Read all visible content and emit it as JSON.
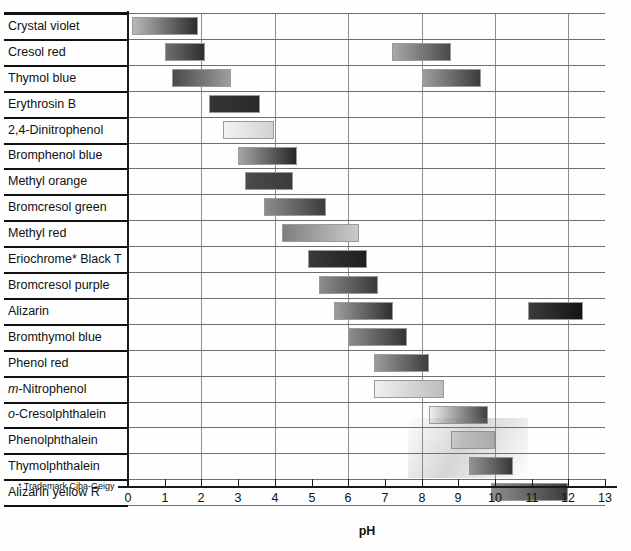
{
  "chart_data": {
    "type": "bar",
    "title": "",
    "xlabel": "pH",
    "ylabel": "",
    "xlim": [
      0,
      13
    ],
    "xticks": [
      "0",
      "1",
      "2",
      "3",
      "4",
      "5",
      "6",
      "7",
      "8",
      "9",
      "10",
      "11",
      "12",
      "13"
    ],
    "gridlines_every": 2,
    "orientation": "horizontal-range",
    "footnote": "* Trademark Ciba-Geigy",
    "categories": [
      "Crystal violet",
      "Cresol red",
      "Thymol blue",
      "Erythrosin B",
      "2,4-Dinitrophenol",
      "Bromphenol blue",
      "Methyl orange",
      "Bromcresol green",
      "Methyl red",
      "Eriochrome* Black T",
      "Bromcresol purple",
      "Alizarin",
      "Bromthymol blue",
      "Phenol red",
      "m-Nitrophenol",
      "o-Cresolphthalein",
      "Phenolphthalein",
      "Thymolphthalein",
      "Alizarin yellow R"
    ],
    "rows": [
      {
        "name": "Crystal violet",
        "italic_prefix": "",
        "ranges": [
          {
            "start": 0.1,
            "end": 1.9,
            "from": "#b9b9b9",
            "to": "#2c2c2c"
          }
        ]
      },
      {
        "name": "Cresol red",
        "italic_prefix": "",
        "ranges": [
          {
            "start": 1.0,
            "end": 2.1,
            "from": "#6f6f6f",
            "to": "#2e2e2e"
          },
          {
            "start": 7.2,
            "end": 8.8,
            "from": "#a8a8a8",
            "to": "#4a4a4a"
          }
        ]
      },
      {
        "name": "Thymol blue",
        "italic_prefix": "",
        "ranges": [
          {
            "start": 1.2,
            "end": 2.8,
            "from": "#4a4a4a",
            "to": "#9d9d9d"
          },
          {
            "start": 8.0,
            "end": 9.6,
            "from": "#9e9e9e",
            "to": "#3b3b3b"
          }
        ]
      },
      {
        "name": "Erythrosin B",
        "italic_prefix": "",
        "ranges": [
          {
            "start": 2.2,
            "end": 3.6,
            "from": "#353535",
            "to": "#2a2a2a"
          }
        ]
      },
      {
        "name": "2,4-Dinitrophenol",
        "italic_prefix": "",
        "ranges": [
          {
            "start": 2.6,
            "end": 4.0,
            "from": "#f2f2f2",
            "to": "#d3d3d3"
          }
        ]
      },
      {
        "name": "Bromphenol blue",
        "italic_prefix": "",
        "ranges": [
          {
            "start": 3.0,
            "end": 4.6,
            "from": "#a6a6a6",
            "to": "#272727"
          }
        ]
      },
      {
        "name": "Methyl orange",
        "italic_prefix": "",
        "ranges": [
          {
            "start": 3.2,
            "end": 4.5,
            "from": "#4b4b4b",
            "to": "#3b3b3b"
          }
        ]
      },
      {
        "name": "Bromcresol green",
        "italic_prefix": "",
        "ranges": [
          {
            "start": 3.7,
            "end": 5.4,
            "from": "#8d8d8d",
            "to": "#3c3c3c"
          }
        ]
      },
      {
        "name": "Methyl red",
        "italic_prefix": "",
        "ranges": [
          {
            "start": 4.2,
            "end": 6.3,
            "from": "#7f7f7f",
            "to": "#cacaca"
          }
        ]
      },
      {
        "name": "Eriochrome* Black T",
        "italic_prefix": "",
        "ranges": [
          {
            "start": 4.9,
            "end": 6.5,
            "from": "#3a3a3a",
            "to": "#1f1f1f"
          }
        ]
      },
      {
        "name": "Bromcresol purple",
        "italic_prefix": "",
        "ranges": [
          {
            "start": 5.2,
            "end": 6.8,
            "from": "#8c8c8c",
            "to": "#3a3a3a"
          }
        ]
      },
      {
        "name": "Alizarin",
        "italic_prefix": "",
        "ranges": [
          {
            "start": 5.6,
            "end": 7.2,
            "from": "#9d9d9d",
            "to": "#2f2f2f"
          },
          {
            "start": 10.9,
            "end": 12.4,
            "from": "#3b3b3b",
            "to": "#141414"
          }
        ]
      },
      {
        "name": "Bromthymol blue",
        "italic_prefix": "",
        "ranges": [
          {
            "start": 6.0,
            "end": 7.6,
            "from": "#8d8d8d",
            "to": "#343434"
          }
        ]
      },
      {
        "name": "Phenol red",
        "italic_prefix": "",
        "ranges": [
          {
            "start": 6.7,
            "end": 8.2,
            "from": "#9c9c9c",
            "to": "#3d3d3d"
          }
        ]
      },
      {
        "name": "m-Nitrophenol",
        "italic_prefix": "m",
        "ranges": [
          {
            "start": 6.7,
            "end": 8.6,
            "from": "#f0f0f0",
            "to": "#bcbcbc"
          }
        ]
      },
      {
        "name": "o-Cresolphthalein",
        "italic_prefix": "o",
        "ranges": [
          {
            "start": 8.2,
            "end": 9.8,
            "from": "#f0f0f0",
            "to": "#3f3f3f"
          }
        ]
      },
      {
        "name": "Phenolphthalein",
        "italic_prefix": "",
        "ranges": [
          {
            "start": 8.8,
            "end": 10.0,
            "from": "#e4e4e4",
            "to": "#b7b7b7"
          }
        ]
      },
      {
        "name": "Thymolphthalein",
        "italic_prefix": "",
        "ranges": [
          {
            "start": 9.3,
            "end": 10.5,
            "from": "#999999",
            "to": "#2f2f2f"
          }
        ]
      },
      {
        "name": "Alizarin yellow R",
        "italic_prefix": "",
        "ranges": [
          {
            "start": 9.9,
            "end": 12.0,
            "from": "#8e8e8e",
            "to": "#3c3c3c"
          }
        ]
      }
    ]
  },
  "layout": {
    "axis_x0_px": 128,
    "px_per_ph": 36.7,
    "plot_top_px": 13,
    "row_height_px": 25.9,
    "row_count": 19,
    "label_col_width_px": 128,
    "axis_line_y_px": 486,
    "tick_label_y_px": 492,
    "axis_title_y_px": 525,
    "footnote_x_px": 18,
    "footnote_y_px": 482
  },
  "colors": {
    "background": "#ffffff",
    "frame": "#111111",
    "gridline": "#8f8f8f",
    "row_separator": "#111111",
    "text": "#111111"
  }
}
